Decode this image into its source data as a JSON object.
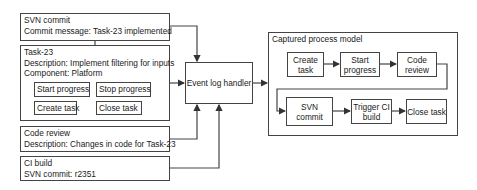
{
  "sources": {
    "svn_commit": {
      "title": "SVN commit",
      "line1": "Commit message: Task-23 implemented"
    },
    "task": {
      "title": "Task-23",
      "line1": "Description: Implement filtering for inputs",
      "line2": "Component: Platform",
      "buttons": [
        "Start progress",
        "Stop progress",
        "Create task",
        "Close task"
      ]
    },
    "code_review": {
      "title": "Code review",
      "line1": "Description: Changes in code for Task-23"
    },
    "ci_build": {
      "title": "CI build",
      "line1": "SVN commit: r2351"
    }
  },
  "handler": {
    "label": "Event log handler"
  },
  "model": {
    "title": "Captured process model",
    "steps": [
      {
        "line1": "Create",
        "line2": "task"
      },
      {
        "line1": "Start",
        "line2": "progress"
      },
      {
        "line1": "Code",
        "line2": "review"
      },
      {
        "line1": "SVN",
        "line2": "commit"
      },
      {
        "line1": "Trigger CI",
        "line2": "build"
      },
      {
        "line1": "Close task",
        "line2": ""
      }
    ]
  },
  "colors": {
    "stroke": "#444444",
    "background": "#ffffff"
  }
}
